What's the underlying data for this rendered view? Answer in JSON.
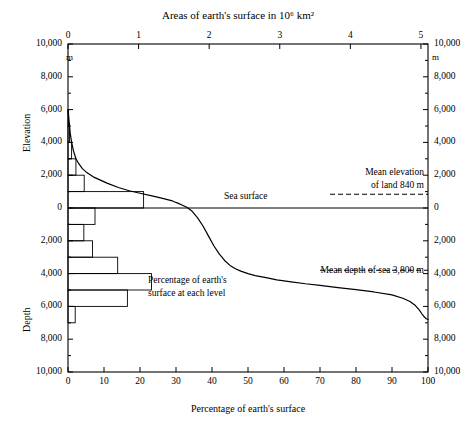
{
  "chart_data": {
    "type": "line",
    "top_axis": {
      "label": "Areas of earth's surface in 10⁶  km²",
      "ticks": [
        0,
        1,
        2,
        3,
        4,
        5
      ],
      "tick_labels": [
        "0",
        "1",
        "2",
        "3",
        "4",
        "5"
      ],
      "range": [
        0,
        5.1
      ],
      "units": "10^6 km^2"
    },
    "bottom_axis": {
      "label": "Percentage of earth's surface",
      "ticks": [
        0,
        10,
        20,
        30,
        40,
        50,
        60,
        70,
        80,
        90,
        100
      ],
      "tick_labels": [
        "0",
        "10",
        "20",
        "30",
        "40",
        "50",
        "60",
        "70",
        "80",
        "90",
        "100"
      ],
      "range": [
        0,
        100
      ],
      "units": "%"
    },
    "left_axis": {
      "upper_label": "Elevation",
      "lower_label": "Depth",
      "unit_label": "m",
      "tick_labels": [
        "10,000",
        "8,000",
        "6,000",
        "4,000",
        "2,000",
        "0",
        "2,000",
        "4,000",
        "6,000",
        "8,000",
        "10,000"
      ],
      "tick_values": [
        10000,
        8000,
        6000,
        4000,
        2000,
        0,
        -2000,
        -4000,
        -6000,
        -8000,
        -10000
      ],
      "range": [
        -10000,
        10000
      ]
    },
    "right_axis": {
      "unit_label": "m",
      "tick_labels": [
        "10,000",
        "8,000",
        "6,000",
        "4,000",
        "2,000",
        "0",
        "2,000",
        "4,000",
        "6,000",
        "8,000",
        "10,000"
      ],
      "tick_values": [
        10000,
        8000,
        6000,
        4000,
        2000,
        0,
        -2000,
        -4000,
        -6000,
        -8000,
        -10000
      ]
    },
    "grid": false,
    "legend_position": "none",
    "series": [
      {
        "name": "Hypsographic curve",
        "type": "line",
        "x": [
          0.0,
          0.3,
          0.6,
          1.0,
          1.5,
          2.2,
          3.0,
          4.0,
          5.0,
          7.0,
          9.0,
          11.0,
          14.0,
          17.0,
          20.0,
          23.0,
          26.0,
          29.0,
          29.5,
          30.5,
          31.5,
          33.0,
          34.5,
          36.0,
          37.5,
          39.0,
          40.5,
          42.0,
          43.5,
          45.0,
          46.5,
          48.0,
          50.0,
          52.0,
          55.0,
          58.0,
          62.0,
          66.0,
          70.0,
          75.0,
          80.0,
          85.0,
          90.0,
          93.0,
          95.0,
          96.5,
          97.5,
          98.3,
          99.0,
          99.5,
          100.0
        ],
        "y": [
          6000,
          5300,
          4600,
          4000,
          3500,
          3000,
          2700,
          2400,
          2200,
          1900,
          1700,
          1500,
          1250,
          1050,
          900,
          750,
          600,
          430,
          380,
          300,
          200,
          50,
          -200,
          -600,
          -1100,
          -1700,
          -2300,
          -2800,
          -3200,
          -3500,
          -3700,
          -3850,
          -4000,
          -4120,
          -4250,
          -4380,
          -4500,
          -4620,
          -4720,
          -4850,
          -4980,
          -5120,
          -5300,
          -5500,
          -5700,
          -5950,
          -6200,
          -6450,
          -6650,
          -6750,
          -6800
        ],
        "xunit": "percent cumulative area",
        "yunit": "m"
      }
    ],
    "histogram": {
      "name": "Percentage of earth's surface at each level",
      "note": "horizontal bars: percent of earth's surface within each 1000 m interval",
      "bins": [
        {
          "top_m": 6000,
          "bottom_m": 5000,
          "percent": 0.1
        },
        {
          "top_m": 5000,
          "bottom_m": 4000,
          "percent": 0.4
        },
        {
          "top_m": 4000,
          "bottom_m": 3000,
          "percent": 1.0
        },
        {
          "top_m": 3000,
          "bottom_m": 2000,
          "percent": 2.2
        },
        {
          "top_m": 2000,
          "bottom_m": 1000,
          "percent": 4.5
        },
        {
          "top_m": 1000,
          "bottom_m": 0,
          "percent": 21.0
        },
        {
          "top_m": 0,
          "bottom_m": -1000,
          "percent": 7.5
        },
        {
          "top_m": -1000,
          "bottom_m": -2000,
          "percent": 4.4
        },
        {
          "top_m": -2000,
          "bottom_m": -3000,
          "percent": 6.8
        },
        {
          "top_m": -3000,
          "bottom_m": -4000,
          "percent": 13.8
        },
        {
          "top_m": -4000,
          "bottom_m": -5000,
          "percent": 23.2
        },
        {
          "top_m": -5000,
          "bottom_m": -6000,
          "percent": 16.5
        },
        {
          "top_m": -6000,
          "bottom_m": -7000,
          "percent": 2.0
        }
      ]
    },
    "reference_lines": [
      {
        "name": "sea-surface",
        "label": "Sea surface",
        "value_m": 0,
        "style": "solid"
      },
      {
        "name": "mean-elevation-of-land",
        "label": "Mean elevation\nof land 840 m",
        "value_m": 840,
        "style": "dashed"
      },
      {
        "name": "mean-depth-of-sea",
        "label": "Mean depth of sea 3,800 m",
        "value_m": -3800,
        "style": "dashed"
      }
    ],
    "annotations": [
      {
        "name": "sea-surface-label",
        "text": "Sea surface"
      },
      {
        "name": "mean-elevation-label-line1",
        "text": "Mean elevation"
      },
      {
        "name": "mean-elevation-label-line2",
        "text": "of land 840 m"
      },
      {
        "name": "mean-depth-label",
        "text": "Mean depth of sea 3,800 m"
      },
      {
        "name": "histogram-label-line1",
        "text": "Percentage of earth's"
      },
      {
        "name": "histogram-label-line2",
        "text": "surface at each level"
      }
    ],
    "colors": {
      "line": "#000000",
      "axis": "#000000",
      "background": "#ffffff"
    }
  }
}
